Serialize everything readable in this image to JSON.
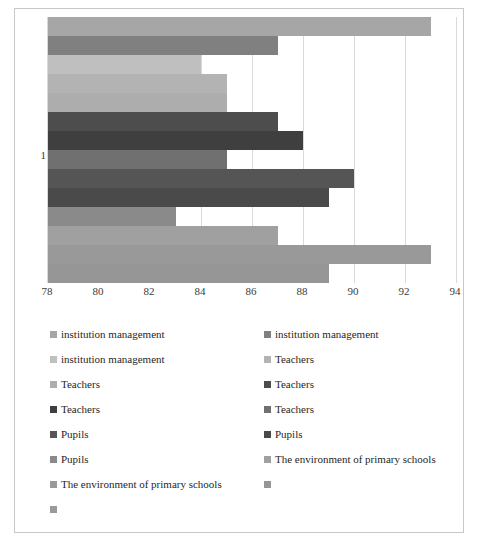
{
  "chart_data": {
    "type": "bar",
    "orientation": "horizontal",
    "title": "",
    "xlabel": "",
    "ylabel": "",
    "categories": [
      "1"
    ],
    "xlim": [
      78,
      94
    ],
    "xticks": [
      "78",
      "80",
      "82",
      "84",
      "86",
      "88",
      "90",
      "92",
      "94"
    ],
    "grid": true,
    "legend_position": "bottom",
    "legend_columns": 2,
    "series": [
      {
        "name": "institution management",
        "color": "#a6a6a6",
        "values": [
          93
        ]
      },
      {
        "name": "institution management",
        "color": "#808080",
        "values": [
          87
        ]
      },
      {
        "name": "institution management",
        "color": "#bfbfbf",
        "values": [
          84
        ]
      },
      {
        "name": "Teachers",
        "color": "#b3b3b3",
        "values": [
          85
        ]
      },
      {
        "name": "Teachers",
        "color": "#adadad",
        "values": [
          85
        ]
      },
      {
        "name": "Teachers",
        "color": "#4d4d4d",
        "values": [
          87
        ]
      },
      {
        "name": "Teachers",
        "color": "#3f3f3f",
        "values": [
          88
        ]
      },
      {
        "name": "Teachers",
        "color": "#707070",
        "values": [
          85
        ]
      },
      {
        "name": "Pupils",
        "color": "#555555",
        "values": [
          90
        ]
      },
      {
        "name": "Pupils",
        "color": "#4a4a4a",
        "values": [
          89
        ]
      },
      {
        "name": "Pupils",
        "color": "#8a8a8a",
        "values": [
          83
        ]
      },
      {
        "name": "The environment of primary schools",
        "color": "#a0a0a0",
        "values": [
          87
        ]
      },
      {
        "name": "The environment of primary schools",
        "color": "#999999",
        "values": [
          93
        ]
      },
      {
        "name": "",
        "color": "#969696",
        "values": [
          89
        ]
      }
    ]
  },
  "legend": {
    "entries": [
      {
        "label": "institution management",
        "color": "#a6a6a6"
      },
      {
        "label": "institution management",
        "color": "#808080"
      },
      {
        "label": "institution management",
        "color": "#bfbfbf"
      },
      {
        "label": "Teachers",
        "color": "#b3b3b3"
      },
      {
        "label": "Teachers",
        "color": "#adadad"
      },
      {
        "label": "Teachers",
        "color": "#4d4d4d"
      },
      {
        "label": "Teachers",
        "color": "#3f3f3f"
      },
      {
        "label": "Teachers",
        "color": "#707070"
      },
      {
        "label": "Pupils",
        "color": "#555555"
      },
      {
        "label": "Pupils",
        "color": "#4a4a4a"
      },
      {
        "label": "Pupils",
        "color": "#8a8a8a"
      },
      {
        "label": "The environment of primary schools",
        "color": "#a0a0a0"
      },
      {
        "label": "The environment of primary schools",
        "color": "#999999"
      },
      {
        "label": "",
        "color": "#969696"
      },
      {
        "label": "",
        "color": "#9a9a9a"
      }
    ]
  }
}
